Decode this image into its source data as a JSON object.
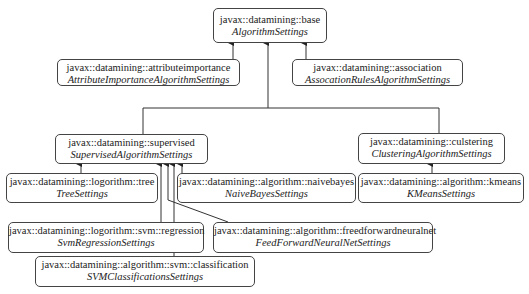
{
  "diagram": {
    "type": "class-hierarchy",
    "nodes": [
      {
        "id": "base",
        "package": "javax::datamining::base",
        "class": "AlgorithmSettings",
        "x": 213,
        "y": 8,
        "w": 114,
        "h": 34
      },
      {
        "id": "attrimp",
        "package": "javax::datamining::attributeimportance",
        "class": "AttributeImportanceAlgorithmSettings",
        "x": 57,
        "y": 59,
        "w": 183,
        "h": 27
      },
      {
        "id": "assoc",
        "package": "javax::datamining::association",
        "class": "AssocationRulesAlgorithmSettings",
        "x": 292,
        "y": 59,
        "w": 171,
        "h": 27
      },
      {
        "id": "supervised",
        "package": "javax::datamining::supervised",
        "class": "SupervisedAlgorithmSettings",
        "x": 55,
        "y": 134,
        "w": 153,
        "h": 29
      },
      {
        "id": "clustering",
        "package": "javax::datamining::culstering",
        "class": "ClusteringAlgorithmSettings",
        "x": 358,
        "y": 133,
        "w": 147,
        "h": 30
      },
      {
        "id": "tree",
        "package": "javax::datamining::logorithm::tree",
        "class": "TreeSettings",
        "x": 6,
        "y": 173,
        "w": 152,
        "h": 30
      },
      {
        "id": "naivebayes",
        "package": "javax::datamining::algorithm::naivebayes",
        "class": "NaiveBayesSettings",
        "x": 177,
        "y": 173,
        "w": 179,
        "h": 30
      },
      {
        "id": "kmeans",
        "package": "javax::datamining::algorithm::kmeans",
        "class": "KMeansSettings",
        "x": 358,
        "y": 173,
        "w": 166,
        "h": 30
      },
      {
        "id": "svmreg",
        "package": "javax::datamining::logorithm::svm::regression",
        "class": "SvmRegressionSettings",
        "x": 8,
        "y": 222,
        "w": 196,
        "h": 31
      },
      {
        "id": "ffnn",
        "package": "javax::datamining::algorithm::freedforwardneuralnet",
        "class": "FeedForwardNeuralNetSettings",
        "x": 213,
        "y": 222,
        "w": 220,
        "h": 31
      },
      {
        "id": "svmclass",
        "package": "javax::datamining::algorithm::svm::classification",
        "class": "SVMClassificationsSettings",
        "x": 35,
        "y": 256,
        "w": 220,
        "h": 31
      }
    ],
    "edges": [
      {
        "from": "attrimp",
        "to": "base"
      },
      {
        "from": "assoc",
        "to": "base"
      },
      {
        "from": "supervised",
        "to": "base"
      },
      {
        "from": "clustering",
        "to": "base"
      },
      {
        "from": "tree",
        "to": "supervised"
      },
      {
        "from": "naivebayes",
        "to": "supervised"
      },
      {
        "from": "svmreg",
        "to": "supervised"
      },
      {
        "from": "ffnn",
        "to": "supervised"
      },
      {
        "from": "svmclass",
        "to": "supervised"
      },
      {
        "from": "kmeans",
        "to": "clustering"
      }
    ],
    "colors": {
      "line": "#333333",
      "border": "#444444",
      "text": "#222222",
      "background": "#ffffff"
    }
  }
}
